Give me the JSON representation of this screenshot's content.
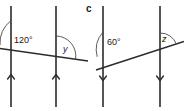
{
  "figure": {
    "part_label": "c",
    "stroke_color": "#2b2b2b",
    "arc_color": "#4a4a4a",
    "label_color": "#1a1a1a",
    "background_color": "#ffffff"
  },
  "diagrams": [
    {
      "name": "left-diagram",
      "arrow_direction": "up",
      "angles": [
        {
          "name": "known-angle",
          "value": "120°"
        },
        {
          "name": "unknown-angle",
          "value": "y"
        }
      ]
    },
    {
      "name": "right-diagram",
      "arrow_direction": "down",
      "angles": [
        {
          "name": "known-angle",
          "value": "60°"
        },
        {
          "name": "unknown-angle",
          "value": "z"
        }
      ]
    }
  ]
}
